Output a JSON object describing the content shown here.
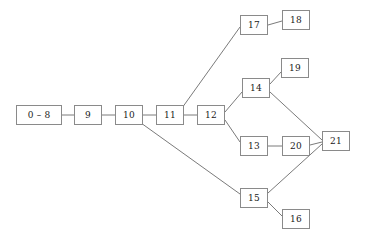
{
  "diagram": {
    "type": "node-link-tree",
    "background_color": "#ffffff",
    "node_border_color": "#8a8a8a",
    "node_fill_color": "#ffffff",
    "edge_color": "#6b6b6b",
    "label_color": "#1a1a1a",
    "nodes": [
      {
        "id": "n0_8",
        "label": "0 – 8",
        "x": 16,
        "y": 105,
        "w": 46,
        "h": 20
      },
      {
        "id": "n9",
        "label": "9",
        "x": 74,
        "y": 105,
        "w": 28,
        "h": 20
      },
      {
        "id": "n10",
        "label": "10",
        "x": 115,
        "y": 105,
        "w": 28,
        "h": 20
      },
      {
        "id": "n11",
        "label": "11",
        "x": 156,
        "y": 105,
        "w": 28,
        "h": 20
      },
      {
        "id": "n12",
        "label": "12",
        "x": 197,
        "y": 105,
        "w": 28,
        "h": 20
      },
      {
        "id": "n17",
        "label": "17",
        "x": 240,
        "y": 15,
        "w": 28,
        "h": 20
      },
      {
        "id": "n18",
        "label": "18",
        "x": 282,
        "y": 10,
        "w": 28,
        "h": 20
      },
      {
        "id": "n14",
        "label": "14",
        "x": 242,
        "y": 78,
        "w": 28,
        "h": 20
      },
      {
        "id": "n19",
        "label": "19",
        "x": 281,
        "y": 58,
        "w": 28,
        "h": 20
      },
      {
        "id": "n13",
        "label": "13",
        "x": 240,
        "y": 136,
        "w": 28,
        "h": 20
      },
      {
        "id": "n20",
        "label": "20",
        "x": 282,
        "y": 136,
        "w": 28,
        "h": 20
      },
      {
        "id": "n21",
        "label": "21",
        "x": 322,
        "y": 131,
        "w": 28,
        "h": 20
      },
      {
        "id": "n15",
        "label": "15",
        "x": 240,
        "y": 188,
        "w": 28,
        "h": 20
      },
      {
        "id": "n16",
        "label": "16",
        "x": 282,
        "y": 209,
        "w": 28,
        "h": 20
      }
    ],
    "edges": [
      {
        "from": "n0_8",
        "to": "n9",
        "x1": 62,
        "y1": 115,
        "x2": 74,
        "y2": 115
      },
      {
        "from": "n9",
        "to": "n10",
        "x1": 102,
        "y1": 115,
        "x2": 115,
        "y2": 115
      },
      {
        "from": "n10",
        "to": "n11",
        "x1": 143,
        "y1": 115,
        "x2": 156,
        "y2": 115
      },
      {
        "from": "n11",
        "to": "n12",
        "x1": 184,
        "y1": 115,
        "x2": 197,
        "y2": 115
      },
      {
        "from": "n11",
        "to": "n17",
        "x1": 182,
        "y1": 108,
        "x2": 240,
        "y2": 27
      },
      {
        "from": "n17",
        "to": "n18",
        "x1": 268,
        "y1": 25,
        "x2": 282,
        "y2": 21
      },
      {
        "from": "n12",
        "to": "n14",
        "x1": 225,
        "y1": 112,
        "x2": 242,
        "y2": 92
      },
      {
        "from": "n14",
        "to": "n19",
        "x1": 270,
        "y1": 84,
        "x2": 281,
        "y2": 72
      },
      {
        "from": "n14",
        "to": "n21",
        "x1": 270,
        "y1": 92,
        "x2": 322,
        "y2": 140
      },
      {
        "from": "n12",
        "to": "n13",
        "x1": 225,
        "y1": 120,
        "x2": 240,
        "y2": 142
      },
      {
        "from": "n13",
        "to": "n20",
        "x1": 268,
        "y1": 146,
        "x2": 282,
        "y2": 146
      },
      {
        "from": "n20",
        "to": "n21",
        "x1": 310,
        "y1": 145,
        "x2": 322,
        "y2": 142
      },
      {
        "from": "n10",
        "to": "n15",
        "x1": 141,
        "y1": 123,
        "x2": 240,
        "y2": 194
      },
      {
        "from": "n15",
        "to": "n21",
        "x1": 268,
        "y1": 193,
        "x2": 322,
        "y2": 144
      },
      {
        "from": "n15",
        "to": "n16",
        "x1": 268,
        "y1": 202,
        "x2": 282,
        "y2": 216
      }
    ]
  }
}
